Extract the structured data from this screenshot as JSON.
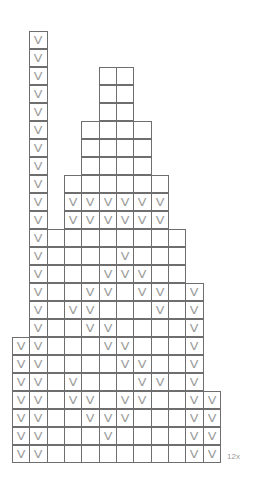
{
  "chart_data": {
    "type": "table",
    "title": "",
    "grid": {
      "columns": 12,
      "rows": 24,
      "origin_x": 12,
      "origin_y": 31,
      "cell_width": 17.33,
      "cell_height": 18
    },
    "rows": [
      {
        "row": 0,
        "ranges": [
          [
            1,
            1
          ]
        ],
        "marked": [
          1
        ]
      },
      {
        "row": 1,
        "ranges": [
          [
            1,
            1
          ]
        ],
        "marked": [
          1
        ]
      },
      {
        "row": 2,
        "ranges": [
          [
            1,
            1
          ],
          [
            5,
            6
          ]
        ],
        "marked": [
          1
        ]
      },
      {
        "row": 3,
        "ranges": [
          [
            1,
            1
          ],
          [
            5,
            6
          ]
        ],
        "marked": [
          1
        ]
      },
      {
        "row": 4,
        "ranges": [
          [
            1,
            1
          ],
          [
            5,
            6
          ]
        ],
        "marked": [
          1
        ]
      },
      {
        "row": 5,
        "ranges": [
          [
            1,
            1
          ],
          [
            4,
            7
          ]
        ],
        "marked": [
          1
        ]
      },
      {
        "row": 6,
        "ranges": [
          [
            1,
            1
          ],
          [
            4,
            7
          ]
        ],
        "marked": [
          1
        ]
      },
      {
        "row": 7,
        "ranges": [
          [
            1,
            1
          ],
          [
            4,
            7
          ]
        ],
        "marked": [
          1
        ]
      },
      {
        "row": 8,
        "ranges": [
          [
            1,
            1
          ],
          [
            3,
            8
          ]
        ],
        "marked": [
          1
        ]
      },
      {
        "row": 9,
        "ranges": [
          [
            1,
            1
          ],
          [
            3,
            8
          ]
        ],
        "marked": [
          1,
          3,
          4,
          5,
          6,
          7,
          8
        ]
      },
      {
        "row": 10,
        "ranges": [
          [
            1,
            1
          ],
          [
            3,
            8
          ]
        ],
        "marked": [
          1,
          3,
          4,
          5,
          6,
          7,
          8
        ]
      },
      {
        "row": 11,
        "ranges": [
          [
            1,
            9
          ]
        ],
        "marked": [
          1
        ]
      },
      {
        "row": 12,
        "ranges": [
          [
            1,
            9
          ]
        ],
        "marked": [
          1,
          6
        ]
      },
      {
        "row": 13,
        "ranges": [
          [
            1,
            9
          ]
        ],
        "marked": [
          1,
          5,
          6,
          7
        ]
      },
      {
        "row": 14,
        "ranges": [
          [
            1,
            10
          ]
        ],
        "marked": [
          1,
          4,
          5,
          7,
          8,
          10
        ]
      },
      {
        "row": 15,
        "ranges": [
          [
            1,
            10
          ]
        ],
        "marked": [
          1,
          3,
          4,
          8,
          10
        ]
      },
      {
        "row": 16,
        "ranges": [
          [
            1,
            10
          ]
        ],
        "marked": [
          1,
          4,
          5,
          10
        ]
      },
      {
        "row": 17,
        "ranges": [
          [
            0,
            10
          ]
        ],
        "marked": [
          0,
          1,
          5,
          6,
          10
        ]
      },
      {
        "row": 18,
        "ranges": [
          [
            0,
            10
          ]
        ],
        "marked": [
          0,
          1,
          6,
          7,
          10
        ]
      },
      {
        "row": 19,
        "ranges": [
          [
            0,
            10
          ]
        ],
        "marked": [
          0,
          1,
          3,
          7,
          8,
          10
        ]
      },
      {
        "row": 20,
        "ranges": [
          [
            0,
            11
          ]
        ],
        "marked": [
          0,
          1,
          3,
          4,
          6,
          7,
          10,
          11
        ]
      },
      {
        "row": 21,
        "ranges": [
          [
            0,
            11
          ]
        ],
        "marked": [
          0,
          1,
          4,
          5,
          6,
          10,
          11
        ]
      },
      {
        "row": 22,
        "ranges": [
          [
            0,
            11
          ]
        ],
        "marked": [
          0,
          1,
          5,
          10,
          11
        ]
      },
      {
        "row": 23,
        "ranges": [
          [
            0,
            11
          ]
        ],
        "marked": [
          0,
          1,
          10,
          11
        ]
      }
    ],
    "mark_symbol": "V",
    "annotations": [
      "12x"
    ]
  },
  "labels": {
    "repeat": "12x"
  },
  "colors": {
    "grid_line": "#6e6e6e",
    "mark": "#9a9a9a",
    "label": "#9a9a9a"
  }
}
